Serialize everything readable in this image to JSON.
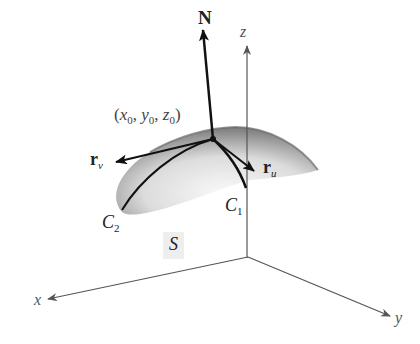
{
  "figure": {
    "labels": {
      "normal": "N",
      "point": {
        "open": "(",
        "x": "x",
        "x_sub": "0",
        "sep1": ", ",
        "y": "y",
        "y_sub": "0",
        "sep2": ", ",
        "z": "z",
        "z_sub": "0",
        "close": ")"
      },
      "r_v": {
        "base": "r",
        "sub": "v"
      },
      "r_u": {
        "base": "r",
        "sub": "u"
      },
      "c1": {
        "base": "C",
        "sub": "1"
      },
      "c2": {
        "base": "C",
        "sub": "2"
      },
      "surface": "S",
      "axis_x": "x",
      "axis_y": "y",
      "axis_z": "z"
    },
    "colors": {
      "axis": "#555555",
      "vector": "#111111",
      "surface_dark": "#8a8a8a",
      "surface_light": "#f2f2f2"
    }
  }
}
